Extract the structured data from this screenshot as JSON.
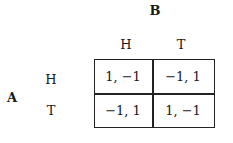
{
  "players": {
    "column_player": "B",
    "row_player": "A"
  },
  "column_strategies": [
    "H",
    "T"
  ],
  "row_strategies": [
    "H",
    "T"
  ],
  "payoffs": [
    [
      "1, −1",
      "−1, 1"
    ],
    [
      "−1, 1",
      "1, −1"
    ]
  ]
}
